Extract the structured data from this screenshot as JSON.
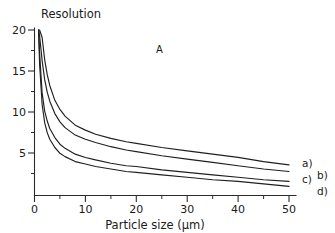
{
  "chart_data": {
    "type": "line",
    "title": "Resolution",
    "xlabel": "Particle size (µm)",
    "ylabel": "Resolution",
    "panel_label": "A",
    "xlim": [
      0,
      52
    ],
    "ylim": [
      0,
      20
    ],
    "xticks": [
      0,
      10,
      20,
      30,
      40,
      50
    ],
    "xtick_labels": [
      "0",
      "10",
      "20",
      "30",
      "40",
      "50"
    ],
    "xminor_ticks": [
      5,
      15,
      25,
      35,
      45
    ],
    "yticks": [
      5,
      10,
      15,
      20
    ],
    "ytick_labels": [
      "5",
      "10",
      "15",
      "20"
    ],
    "yminor_ticks": [
      2.5,
      7.5,
      12.5,
      17.5
    ],
    "grid": false,
    "legend_position": "right-of-curve-ends",
    "x": [
      0.8,
      1,
      1.5,
      2,
      2.5,
      3,
      4,
      5,
      6,
      8,
      10,
      12,
      15,
      18,
      20,
      25,
      30,
      35,
      40,
      45,
      50
    ],
    "series": [
      {
        "name": "a)",
        "label": "a)",
        "color": "#1f1f1f",
        "values": [
          20,
          20,
          19.1,
          16.4,
          14.6,
          13.3,
          11.5,
          10.4,
          9.6,
          8.5,
          7.9,
          7.4,
          6.9,
          6.5,
          6.3,
          5.8,
          5.4,
          5.0,
          4.6,
          4.1,
          3.7
        ]
      },
      {
        "name": "b)",
        "label": "b)",
        "color": "#1f1f1f",
        "values": [
          20,
          19.3,
          16.3,
          14.0,
          12.5,
          11.4,
          9.9,
          8.9,
          8.2,
          7.3,
          6.8,
          6.4,
          5.9,
          5.5,
          5.3,
          4.8,
          4.4,
          4.0,
          3.6,
          3.2,
          2.9
        ]
      },
      {
        "name": "c)",
        "label": "c)",
        "color": "#1f1f1f",
        "values": [
          20,
          17.2,
          12.4,
          10.2,
          9.0,
          8.1,
          7.0,
          6.2,
          5.7,
          5.0,
          4.6,
          4.3,
          3.9,
          3.6,
          3.5,
          3.1,
          2.8,
          2.5,
          2.2,
          1.9,
          1.7
        ]
      },
      {
        "name": "d)",
        "label": "d)",
        "color": "#1f1f1f",
        "values": [
          20,
          15.9,
          11.0,
          8.8,
          7.6,
          6.8,
          5.8,
          5.1,
          4.7,
          4.1,
          3.8,
          3.5,
          3.2,
          2.9,
          2.8,
          2.5,
          2.2,
          1.9,
          1.7,
          1.4,
          1.1
        ]
      }
    ]
  },
  "labels": {
    "title": "Resolution",
    "xaxis": "Particle size (µm)",
    "panel": "A",
    "x_0": "0",
    "x_10": "10",
    "x_20": "20",
    "x_30": "30",
    "x_40": "40",
    "x_50": "50",
    "y_5": "5",
    "y_10": "10",
    "y_15": "15",
    "y_20": "20",
    "series_a": "a)",
    "series_b": "b)",
    "series_c": "c)",
    "series_d": "d)"
  }
}
